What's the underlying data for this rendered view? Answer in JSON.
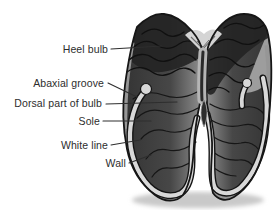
{
  "figure": {
    "labels": [
      {
        "id": "heel-bulb",
        "text": "Heel bulb"
      },
      {
        "id": "abaxial-groove",
        "text": "Abaxial groove"
      },
      {
        "id": "dorsal-part-of-bulb",
        "text": "Dorsal part of bulb"
      },
      {
        "id": "sole",
        "text": "Sole"
      },
      {
        "id": "white-line",
        "text": "White line"
      },
      {
        "id": "wall",
        "text": "Wall"
      }
    ],
    "colors": {
      "background": "#ffffff",
      "outline": "#161616",
      "horn_dark": "#2c2c2c",
      "horn_mid": "#565656",
      "horn_light_edge": "#8f8f8f",
      "wall_band": "#969696",
      "white_line_band": "#d8d8d8",
      "interbulbar_light": "#d4d4d4",
      "shadow": "#c9c9c9",
      "label_text": "#2d2d2d",
      "leader_line": "#2e2e2e"
    }
  }
}
